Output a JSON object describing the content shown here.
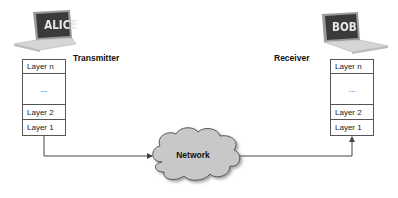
{
  "transmitter": {
    "device_label": "ALICE",
    "role_label": "Transmitter",
    "layers": [
      "Layer n",
      "...",
      "Layer 2",
      "Layer 1"
    ]
  },
  "receiver": {
    "device_label": "BOB",
    "role_label": "Receiver",
    "layers": [
      "Layer n",
      "...",
      "Layer 2",
      "Layer 1"
    ]
  },
  "network": {
    "label": "Network"
  },
  "colors": {
    "laptop_screen": "#3a3a3a",
    "laptop_body": "#d6d6d6",
    "cloud_fill": "#c8c8c8",
    "cloud_stroke": "#555555",
    "line": "#444444"
  }
}
